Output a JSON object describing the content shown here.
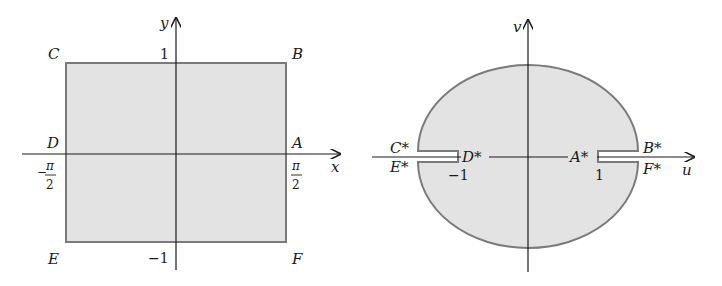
{
  "colors": {
    "region_fill": "#e3e3e3",
    "region_stroke": "#7a7a7a",
    "axis": "#1a1a1a",
    "background": "#ffffff"
  },
  "left_panel": {
    "title": "z-plane rectangle",
    "axes": {
      "x_label": "x",
      "y_label": "y"
    },
    "ticks": {
      "y_top": "1",
      "y_bottom": "−1",
      "x_left_num": "π",
      "x_left_den": "2",
      "x_left_sign": "−",
      "x_right_num": "π",
      "x_right_den": "2"
    },
    "corner_labels": {
      "A": "A",
      "B": "B",
      "C": "C",
      "D": "D",
      "E": "E",
      "F": "F"
    }
  },
  "right_panel": {
    "title": "w-plane ellipse with slits",
    "axes": {
      "x_label": "u",
      "y_label": "v"
    },
    "ticks": {
      "u_left": "−1",
      "u_right": "1"
    },
    "point_labels": {
      "A": "A*",
      "B": "B*",
      "C": "C*",
      "D": "D*",
      "E": "E*",
      "F": "F*"
    }
  }
}
